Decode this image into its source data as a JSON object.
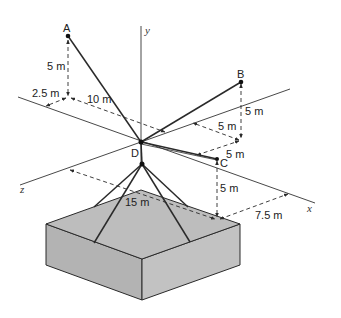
{
  "diagram": {
    "points": {
      "A": "A",
      "B": "B",
      "C": "C",
      "D": "D"
    },
    "axes": {
      "x": "x",
      "y": "y",
      "z": "z"
    },
    "dimensions": {
      "a_height": "5 m",
      "a_z_offset": "2.5 m",
      "a_x_offset": "10 m",
      "b_height": "5 m",
      "b_x_offset": "5 m",
      "c_offset": "5 m",
      "c_height": "5 m",
      "load_z": "15 m",
      "load_x": "7.5 m"
    },
    "colors": {
      "line": "#2a2a2a",
      "box_top": "#bdbdbd",
      "box_left": "#b3b3b3",
      "box_right": "#c2c2c2"
    }
  }
}
